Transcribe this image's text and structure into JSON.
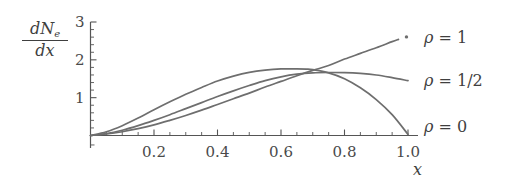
{
  "figure": {
    "background": "#ffffff",
    "curve_color": "#6e6e6e",
    "axis_color": "#555555",
    "text_color": "#3f3f3f"
  },
  "axes": {
    "y_label_numerator_prefix": "dN",
    "y_label_numerator_subscript": "e",
    "y_label_denominator": "dx",
    "x_label": "x"
  },
  "chart_data": {
    "type": "line",
    "title": "",
    "subtitle": "",
    "xlabel": "x",
    "ylabel": "dN_e/dx",
    "xlim": [
      0,
      1.05
    ],
    "ylim": [
      0,
      3
    ],
    "grid": false,
    "legend_position": "right",
    "x_ticks_major": [
      0.2,
      0.4,
      0.6,
      0.8,
      1.0
    ],
    "x_tick_labels": [
      "0.2",
      "0.4",
      "0.6",
      "0.8",
      "1.0"
    ],
    "x_ticks_minor": [
      0.1,
      0.3,
      0.5,
      0.7,
      0.9
    ],
    "y_ticks_major": [
      1,
      2,
      3
    ],
    "y_tick_labels": [
      "1",
      "2",
      "3"
    ],
    "y_ticks_minor": [
      0.2,
      0.4,
      0.6,
      0.8,
      1.2,
      1.4,
      1.6,
      1.8,
      2.2,
      2.4,
      2.6,
      2.8
    ],
    "crossing_point": {
      "x": 0.75,
      "y": 1.65
    },
    "series": [
      {
        "name": "rho-1",
        "legend_label": "ρ = 1",
        "legend_symbol": "ρ",
        "legend_value": "1",
        "has_endpoint_marker": true,
        "x": [
          0.0,
          0.05,
          0.1,
          0.15,
          0.2,
          0.25,
          0.3,
          0.35,
          0.4,
          0.45,
          0.5,
          0.55,
          0.6,
          0.65,
          0.7,
          0.75,
          0.8,
          0.85,
          0.9,
          0.95,
          0.97
        ],
        "y": [
          0.0,
          0.04,
          0.1,
          0.18,
          0.28,
          0.4,
          0.53,
          0.67,
          0.82,
          0.97,
          1.12,
          1.28,
          1.43,
          1.58,
          1.72,
          1.85,
          2.02,
          2.17,
          2.32,
          2.48,
          2.54
        ]
      },
      {
        "name": "rho-1-2",
        "legend_label": "ρ = 1/2",
        "legend_symbol": "ρ",
        "legend_value": "1/2",
        "has_endpoint_marker": false,
        "x": [
          0.0,
          0.05,
          0.1,
          0.15,
          0.2,
          0.25,
          0.3,
          0.35,
          0.4,
          0.45,
          0.5,
          0.55,
          0.6,
          0.65,
          0.7,
          0.75,
          0.8,
          0.85,
          0.9,
          0.95,
          1.0
        ],
        "y": [
          0.0,
          0.05,
          0.14,
          0.26,
          0.4,
          0.55,
          0.71,
          0.87,
          1.03,
          1.18,
          1.32,
          1.45,
          1.55,
          1.62,
          1.655,
          1.665,
          1.66,
          1.64,
          1.6,
          1.53,
          1.45
        ]
      },
      {
        "name": "rho-0",
        "legend_label": "ρ = 0",
        "legend_symbol": "ρ",
        "legend_value": "0",
        "has_endpoint_marker": false,
        "x": [
          0.0,
          0.05,
          0.1,
          0.15,
          0.2,
          0.25,
          0.3,
          0.35,
          0.4,
          0.45,
          0.5,
          0.55,
          0.6,
          0.65,
          0.68,
          0.7,
          0.75,
          0.8,
          0.85,
          0.9,
          0.95,
          1.0
        ],
        "y": [
          0.0,
          0.1,
          0.26,
          0.46,
          0.68,
          0.89,
          1.09,
          1.27,
          1.44,
          1.57,
          1.67,
          1.73,
          1.76,
          1.76,
          1.755,
          1.74,
          1.655,
          1.5,
          1.26,
          0.95,
          0.55,
          0.03
        ]
      }
    ],
    "legend_entries": [
      "ρ = 1",
      "ρ = 1/2",
      "ρ = 0"
    ]
  }
}
